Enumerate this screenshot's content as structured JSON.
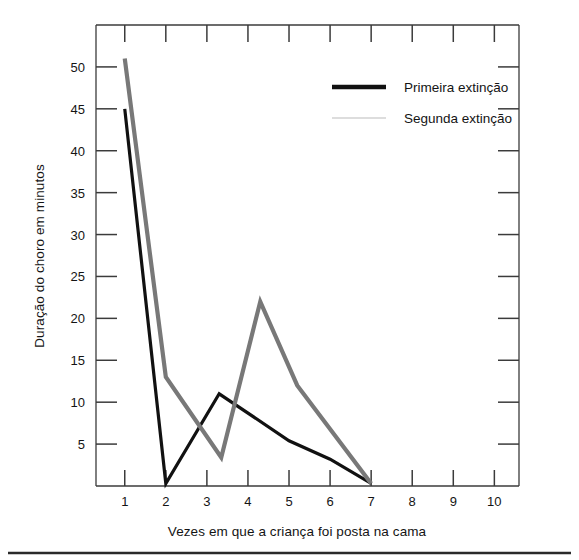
{
  "chart_data": {
    "type": "line",
    "title": "",
    "xlabel": "Vezes em que a criança foi posta na cama",
    "ylabel": "Duração do choro em minutos",
    "xlim": [
      0.3,
      10.6
    ],
    "ylim": [
      0,
      55
    ],
    "xticks": [
      1,
      2,
      3,
      4,
      5,
      6,
      7,
      8,
      9,
      10
    ],
    "xtick_labels": [
      "1",
      "2",
      "3",
      "4",
      "5",
      "6",
      "7",
      "8",
      "9",
      "10"
    ],
    "yticks": [
      5,
      10,
      15,
      20,
      25,
      30,
      35,
      40,
      45,
      50
    ],
    "ytick_labels": [
      "5",
      "10",
      "15",
      "20",
      "25",
      "30",
      "35",
      "40",
      "45",
      "50"
    ],
    "grid": false,
    "legend_position": "upper right",
    "series": [
      {
        "name": "Primeira extinção",
        "color": "#111111",
        "linewidth": 3.2,
        "x": [
          1,
          2,
          3.3,
          5.0,
          6.0,
          7
        ],
        "values": [
          45,
          0.3,
          11,
          5.4,
          3.2,
          0.3
        ]
      },
      {
        "name": "Segunda extinção",
        "color": "#787878",
        "linewidth": 4.2,
        "x": [
          1,
          2,
          3.35,
          4.3,
          5.2,
          7
        ],
        "values": [
          51,
          13,
          3.4,
          22,
          12,
          0.3
        ]
      }
    ]
  },
  "legend": {
    "entries": [
      {
        "label": "Primeira extinção",
        "swatch_color": "#111111",
        "swatch_style": "solid-thick"
      },
      {
        "label": "Segunda extinção",
        "swatch_color": "#d8d8d8",
        "swatch_style": "faint-thin"
      }
    ]
  },
  "axes": {
    "y_axis_title": "Duração do choro em minutos",
    "x_axis_title": "Vezes em que a criança foi posta na cama"
  }
}
